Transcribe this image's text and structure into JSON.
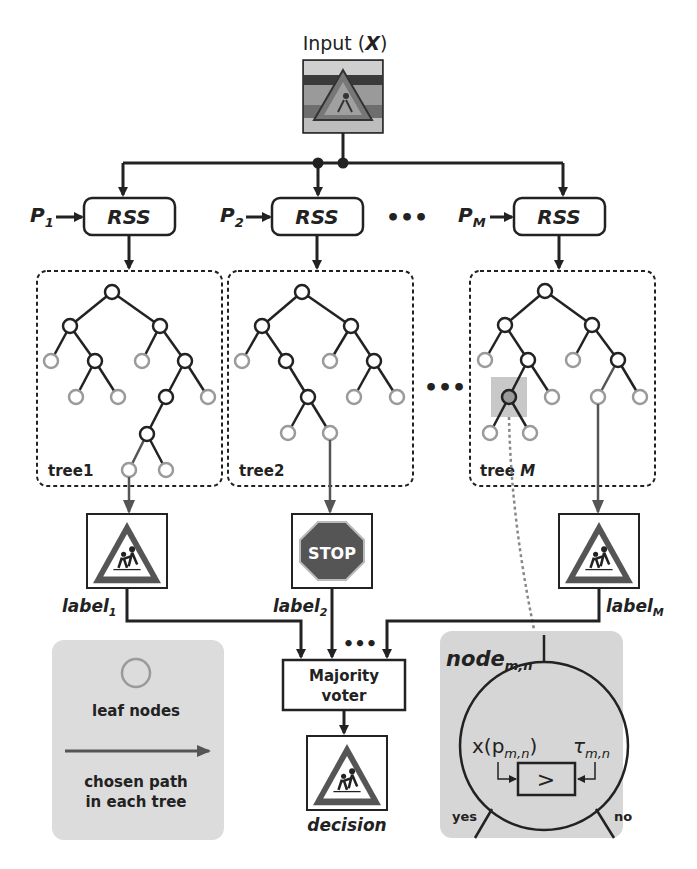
{
  "input": {
    "label": "Input (",
    "var": "X",
    "close": ")"
  },
  "rss": [
    {
      "param": "P",
      "sub": "1",
      "label": "RSS"
    },
    {
      "param": "P",
      "sub": "2",
      "label": "RSS"
    },
    {
      "param": "P",
      "sub": "M",
      "label": "RSS"
    }
  ],
  "ellipsis": "•••",
  "trees": [
    {
      "label": "tree1"
    },
    {
      "label": "tree2"
    },
    {
      "label": "tree ",
      "label_italic": "M"
    }
  ],
  "labels": [
    {
      "text": "label",
      "sub": "1",
      "sign": "school-crossing"
    },
    {
      "text": "label",
      "sub": "2",
      "sign": "stop"
    },
    {
      "text": "label",
      "sub": "M",
      "sign": "school-crossing"
    }
  ],
  "stop_text": "STOP",
  "voter": {
    "line1": "Majority",
    "line2": "voter"
  },
  "decision": {
    "label": "decision",
    "sign": "school-crossing"
  },
  "legend": {
    "leaf": "leaf nodes",
    "path_line1": "chosen path",
    "path_line2": "in each tree"
  },
  "node_detail": {
    "title": "node",
    "title_sub": "m,n",
    "feature": "x(p",
    "feature_sub": "m,n",
    "feature_close": ")",
    "threshold": "τ",
    "threshold_sub": "m,n",
    "comparator": ">",
    "yes": "yes",
    "no": "no"
  },
  "colors": {
    "line": "#222222",
    "leaf": "#9a9a9a",
    "panel": "#d9d9d9",
    "stop": "#555555"
  }
}
